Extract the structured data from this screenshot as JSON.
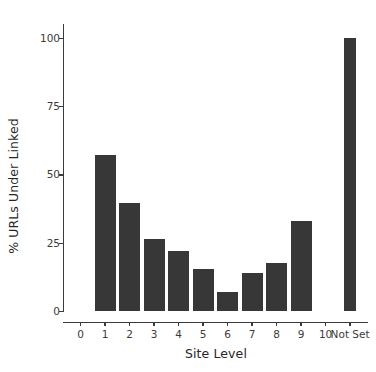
{
  "chart_data": {
    "type": "bar",
    "title": "",
    "subtitle": "",
    "xlabel": "Site Level",
    "ylabel": "% URLs Under Linked",
    "categories": [
      "0",
      "1",
      "2",
      "3",
      "4",
      "5",
      "6",
      "7",
      "8",
      "9",
      "10",
      "Not Set"
    ],
    "values": [
      null,
      57,
      39.5,
      26.5,
      22,
      15.5,
      7,
      14,
      17.5,
      33,
      null,
      100
    ],
    "xtick_labels": [
      "0",
      "1",
      "2",
      "3",
      "4",
      "5",
      "6",
      "7",
      "8",
      "9",
      "10",
      "Not Set"
    ],
    "ytick_labels": [
      "0",
      "25",
      "50",
      "75",
      "100"
    ],
    "ytick_values": [
      0,
      25,
      50,
      75,
      100
    ],
    "ylim": [
      0,
      105
    ],
    "grid": false,
    "legend": false,
    "legend_position": "none",
    "bar_color": "#373737",
    "axis_color": "#3b3b3b",
    "background_color": "#ffffff",
    "annotations": []
  }
}
